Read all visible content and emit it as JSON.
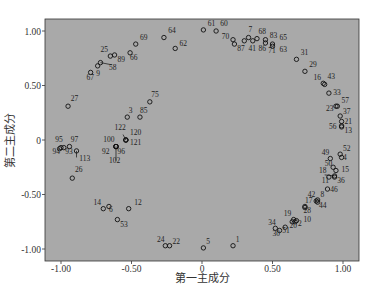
{
  "chart_data": {
    "type": "scatter",
    "title": "",
    "xlabel": "第一主成分",
    "ylabel": "第二主成分",
    "xlim": [
      -1.1,
      1.12
    ],
    "ylim": [
      -1.1,
      1.1
    ],
    "xticks": [
      -1.0,
      -0.5,
      0,
      0.5,
      1.0
    ],
    "xtick_labels": [
      "-1.00",
      "-0.50",
      "0",
      "0.50",
      "1.00"
    ],
    "yticks": [
      1.0,
      0.5,
      0,
      -0.5,
      -1.0
    ],
    "ytick_labels": [
      "1.00",
      "0.50",
      "0",
      "-0.50",
      "-1.00"
    ],
    "grid": false,
    "legend": null,
    "background": "#a9a9a9",
    "marker": "open-circle",
    "points": [
      {
        "id": "61",
        "x": 0.01,
        "y": 1.01
      },
      {
        "id": "60",
        "x": 0.1,
        "y": 1.0
      },
      {
        "id": "70",
        "x": 0.22,
        "y": 0.92
      },
      {
        "id": "87",
        "x": 0.23,
        "y": 0.88
      },
      {
        "id": "41",
        "x": 0.3,
        "y": 0.91
      },
      {
        "id": "7",
        "x": 0.33,
        "y": 0.94
      },
      {
        "id": "86",
        "x": 0.36,
        "y": 0.91
      },
      {
        "id": "68",
        "x": 0.39,
        "y": 0.93
      },
      {
        "id": "83",
        "x": 0.45,
        "y": 0.92
      },
      {
        "id": "71",
        "x": 0.45,
        "y": 0.89
      },
      {
        "id": "65",
        "x": 0.5,
        "y": 0.88
      },
      {
        "id": "63",
        "x": 0.5,
        "y": 0.86
      },
      {
        "id": "31",
        "x": 0.67,
        "y": 0.74
      },
      {
        "id": "29",
        "x": 0.73,
        "y": 0.63
      },
      {
        "id": "16",
        "x": 0.86,
        "y": 0.52
      },
      {
        "id": "43",
        "x": 0.87,
        "y": 0.51
      },
      {
        "id": "33",
        "x": 0.9,
        "y": 0.43
      },
      {
        "id": "23",
        "x": 0.95,
        "y": 0.31
      },
      {
        "id": "57",
        "x": 0.96,
        "y": 0.31
      },
      {
        "id": "37",
        "x": 0.98,
        "y": 0.22
      },
      {
        "id": "21",
        "x": 0.99,
        "y": 0.17
      },
      {
        "id": "56",
        "x": 0.99,
        "y": 0.13
      },
      {
        "id": "13",
        "x": 0.99,
        "y": 0.12
      },
      {
        "id": "64",
        "x": -0.27,
        "y": 0.94
      },
      {
        "id": "62",
        "x": -0.19,
        "y": 0.84
      },
      {
        "id": "69",
        "x": -0.47,
        "y": 0.88
      },
      {
        "id": "66",
        "x": -0.51,
        "y": 0.8
      },
      {
        "id": "25",
        "x": -0.65,
        "y": 0.77
      },
      {
        "id": "89",
        "x": -0.62,
        "y": 0.78
      },
      {
        "id": "58",
        "x": -0.72,
        "y": 0.71
      },
      {
        "id": "9",
        "x": -0.74,
        "y": 0.68
      },
      {
        "id": "67",
        "x": -0.79,
        "y": 0.62
      },
      {
        "id": "27",
        "x": -0.95,
        "y": 0.31
      },
      {
        "id": "75",
        "x": -0.37,
        "y": 0.35
      },
      {
        "id": "85",
        "x": -0.44,
        "y": 0.21
      },
      {
        "id": "3",
        "x": -0.53,
        "y": 0.21
      },
      {
        "id": "122",
        "x": -0.54,
        "y": 0.0
      },
      {
        "id": "120",
        "x": -0.54,
        "y": 0.0
      },
      {
        "id": "121",
        "x": -0.54,
        "y": 0.0
      },
      {
        "id": "100",
        "x": -0.61,
        "y": -0.06
      },
      {
        "id": "92",
        "x": -0.61,
        "y": -0.06
      },
      {
        "id": "96",
        "x": -0.61,
        "y": -0.06
      },
      {
        "id": "102",
        "x": -0.61,
        "y": -0.06
      },
      {
        "id": "95",
        "x": -1.0,
        "y": -0.07
      },
      {
        "id": "94",
        "x": -1.01,
        "y": -0.08
      },
      {
        "id": "93",
        "x": -0.98,
        "y": -0.07
      },
      {
        "id": "97",
        "x": -0.94,
        "y": -0.06
      },
      {
        "id": "113",
        "x": -0.89,
        "y": -0.1
      },
      {
        "id": "26",
        "x": -0.92,
        "y": -0.35
      },
      {
        "id": "14",
        "x": -0.7,
        "y": -0.63
      },
      {
        "id": "6",
        "x": -0.66,
        "y": -0.61
      },
      {
        "id": "12",
        "x": -0.52,
        "y": -0.63
      },
      {
        "id": "53",
        "x": -0.6,
        "y": -0.73
      },
      {
        "id": "24",
        "x": -0.26,
        "y": -0.97
      },
      {
        "id": "22",
        "x": -0.23,
        "y": -0.97
      },
      {
        "id": "5",
        "x": 0.01,
        "y": -0.99
      },
      {
        "id": "1",
        "x": 0.22,
        "y": -0.97
      },
      {
        "id": "34",
        "x": 0.52,
        "y": -0.81
      },
      {
        "id": "30",
        "x": 0.55,
        "y": -0.83
      },
      {
        "id": "51",
        "x": 0.59,
        "y": -0.8
      },
      {
        "id": "20",
        "x": 0.64,
        "y": -0.75
      },
      {
        "id": "19",
        "x": 0.65,
        "y": -0.73
      },
      {
        "id": "2",
        "x": 0.66,
        "y": -0.75
      },
      {
        "id": "10",
        "x": 0.67,
        "y": -0.74
      },
      {
        "id": "17",
        "x": 0.73,
        "y": -0.61
      },
      {
        "id": "28",
        "x": 0.73,
        "y": -0.62
      },
      {
        "id": "42",
        "x": 0.81,
        "y": -0.56
      },
      {
        "id": "8",
        "x": 0.82,
        "y": -0.55
      },
      {
        "id": "44",
        "x": 0.82,
        "y": -0.57
      },
      {
        "id": "46",
        "x": 0.89,
        "y": -0.45
      },
      {
        "id": "18",
        "x": 0.9,
        "y": -0.34
      },
      {
        "id": "11",
        "x": 0.94,
        "y": -0.33
      },
      {
        "id": "36",
        "x": 0.94,
        "y": -0.34
      },
      {
        "id": "15",
        "x": 0.95,
        "y": -0.28
      },
      {
        "id": "50",
        "x": 0.93,
        "y": -0.25
      },
      {
        "id": "49",
        "x": 0.91,
        "y": -0.17
      },
      {
        "id": "52",
        "x": 0.98,
        "y": -0.13
      },
      {
        "id": "4",
        "x": 0.99,
        "y": -0.16
      }
    ],
    "labels": [
      {
        "id": "61",
        "x": 0.04,
        "y": 1.05
      },
      {
        "id": "60",
        "x": 0.13,
        "y": 1.05
      },
      {
        "id": "70",
        "x": 0.14,
        "y": 0.93
      },
      {
        "id": "87",
        "x": 0.25,
        "y": 0.82
      },
      {
        "id": "41",
        "x": 0.33,
        "y": 0.82
      },
      {
        "id": "7",
        "x": 0.33,
        "y": 0.99
      },
      {
        "id": "86",
        "x": 0.4,
        "y": 0.82
      },
      {
        "id": "68",
        "x": 0.4,
        "y": 0.97
      },
      {
        "id": "83",
        "x": 0.48,
        "y": 0.94
      },
      {
        "id": "71",
        "x": 0.47,
        "y": 0.8
      },
      {
        "id": "65",
        "x": 0.55,
        "y": 0.92
      },
      {
        "id": "63",
        "x": 0.55,
        "y": 0.81
      },
      {
        "id": "31",
        "x": 0.7,
        "y": 0.78
      },
      {
        "id": "29",
        "x": 0.76,
        "y": 0.67
      },
      {
        "id": "16",
        "x": 0.79,
        "y": 0.55
      },
      {
        "id": "43",
        "x": 0.89,
        "y": 0.56
      },
      {
        "id": "33",
        "x": 0.93,
        "y": 0.41
      },
      {
        "id": "23",
        "x": 0.88,
        "y": 0.27
      },
      {
        "id": "57",
        "x": 0.99,
        "y": 0.34
      },
      {
        "id": "37",
        "x": 1.0,
        "y": 0.24
      },
      {
        "id": "21",
        "x": 1.01,
        "y": 0.15
      },
      {
        "id": "56",
        "x": 0.9,
        "y": 0.1
      },
      {
        "id": "13",
        "x": 1.01,
        "y": 0.06
      },
      {
        "id": "64",
        "x": -0.24,
        "y": 0.98
      },
      {
        "id": "62",
        "x": -0.16,
        "y": 0.86
      },
      {
        "id": "69",
        "x": -0.44,
        "y": 0.92
      },
      {
        "id": "66",
        "x": -0.51,
        "y": 0.73
      },
      {
        "id": "25",
        "x": -0.72,
        "y": 0.81
      },
      {
        "id": "89",
        "x": -0.6,
        "y": 0.72
      },
      {
        "id": "58",
        "x": -0.66,
        "y": 0.64
      },
      {
        "id": "9",
        "x": -0.75,
        "y": 0.59
      },
      {
        "id": "67",
        "x": -0.82,
        "y": 0.55
      },
      {
        "id": "27",
        "x": -0.93,
        "y": 0.36
      },
      {
        "id": "75",
        "x": -0.36,
        "y": 0.39
      },
      {
        "id": "85",
        "x": -0.44,
        "y": 0.25
      },
      {
        "id": "3",
        "x": -0.52,
        "y": 0.25
      },
      {
        "id": "122",
        "x": -0.62,
        "y": 0.09
      },
      {
        "id": "120",
        "x": -0.51,
        "y": 0.05
      },
      {
        "id": "121",
        "x": -0.51,
        "y": -0.05
      },
      {
        "id": "100",
        "x": -0.7,
        "y": -0.02
      },
      {
        "id": "92",
        "x": -0.71,
        "y": -0.13
      },
      {
        "id": "96",
        "x": -0.6,
        "y": -0.13
      },
      {
        "id": "102",
        "x": -0.66,
        "y": -0.21
      },
      {
        "id": "95",
        "x": -1.04,
        "y": -0.02
      },
      {
        "id": "94",
        "x": -1.06,
        "y": -0.13
      },
      {
        "id": "93",
        "x": -0.97,
        "y": -0.13
      },
      {
        "id": "97",
        "x": -0.93,
        "y": -0.02
      },
      {
        "id": "113",
        "x": -0.87,
        "y": -0.19
      },
      {
        "id": "26",
        "x": -0.9,
        "y": -0.29
      },
      {
        "id": "14",
        "x": -0.77,
        "y": -0.6
      },
      {
        "id": "6",
        "x": -0.66,
        "y": -0.66
      },
      {
        "id": "12",
        "x": -0.48,
        "y": -0.6
      },
      {
        "id": "53",
        "x": -0.58,
        "y": -0.8
      },
      {
        "id": "24",
        "x": -0.32,
        "y": -0.94
      },
      {
        "id": "22",
        "x": -0.21,
        "y": -0.95
      },
      {
        "id": "5",
        "x": 0.03,
        "y": -0.95
      },
      {
        "id": "1",
        "x": 0.24,
        "y": -0.94
      },
      {
        "id": "34",
        "x": 0.47,
        "y": -0.78
      },
      {
        "id": "30",
        "x": 0.5,
        "y": -0.88
      },
      {
        "id": "51",
        "x": 0.57,
        "y": -0.85
      },
      {
        "id": "20",
        "x": 0.62,
        "y": -0.81
      },
      {
        "id": "19",
        "x": 0.58,
        "y": -0.7
      },
      {
        "id": "2",
        "x": 0.68,
        "y": -0.79
      },
      {
        "id": "10",
        "x": 0.72,
        "y": -0.75
      },
      {
        "id": "17",
        "x": 0.73,
        "y": -0.58
      },
      {
        "id": "28",
        "x": 0.72,
        "y": -0.67
      },
      {
        "id": "42",
        "x": 0.75,
        "y": -0.52
      },
      {
        "id": "8",
        "x": 0.84,
        "y": -0.52
      },
      {
        "id": "44",
        "x": 0.83,
        "y": -0.62
      },
      {
        "id": "46",
        "x": 0.91,
        "y": -0.48
      },
      {
        "id": "18",
        "x": 0.83,
        "y": -0.3
      },
      {
        "id": "11",
        "x": 0.85,
        "y": -0.39
      },
      {
        "id": "36",
        "x": 0.96,
        "y": -0.39
      },
      {
        "id": "15",
        "x": 0.99,
        "y": -0.29
      },
      {
        "id": "50",
        "x": 0.87,
        "y": -0.24
      },
      {
        "id": "49",
        "x": 0.85,
        "y": -0.14
      },
      {
        "id": "52",
        "x": 1.0,
        "y": -0.1
      },
      {
        "id": "4",
        "x": 1.0,
        "y": -0.18
      }
    ],
    "leader_lines": [
      {
        "from": [
          -0.72,
          0.71
        ],
        "to": [
          -0.64,
          0.69
        ]
      },
      {
        "from": [
          -0.56,
          0.05
        ],
        "to": [
          -0.54,
          0.0
        ]
      },
      {
        "from": [
          -0.61,
          -0.06
        ],
        "to": [
          -0.61,
          -0.19
        ]
      },
      {
        "from": [
          -0.89,
          -0.1
        ],
        "to": [
          -0.89,
          -0.16
        ]
      },
      {
        "from": [
          0.87,
          -0.32
        ],
        "to": [
          0.94,
          -0.33
        ]
      }
    ]
  }
}
